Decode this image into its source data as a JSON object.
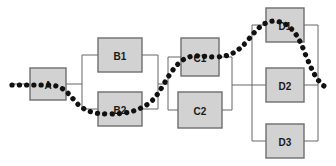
{
  "diagram": {
    "type": "reliability-block-diagram",
    "title": "",
    "canvas": {
      "width": 336,
      "height": 166
    },
    "style": {
      "block_fill": "#d2d2d2",
      "block_border": "#6e6e6e",
      "connector_color": "#666666",
      "trace_color": "#111111",
      "background": "#ffffff"
    },
    "blocks": [
      {
        "id": "A",
        "label": "A",
        "x": 30,
        "y": 68,
        "w": 36,
        "h": 32,
        "stage": "A",
        "label_obscured": true
      },
      {
        "id": "B1",
        "label": "B1",
        "x": 98,
        "y": 38,
        "w": 44,
        "h": 34,
        "stage": "B",
        "label_obscured": false
      },
      {
        "id": "B2",
        "label": "B2",
        "x": 98,
        "y": 92,
        "w": 44,
        "h": 34,
        "stage": "B",
        "label_obscured": true
      },
      {
        "id": "C1",
        "label": "C1",
        "x": 181,
        "y": 38,
        "w": 38,
        "h": 38,
        "stage": "C",
        "label_obscured": true
      },
      {
        "id": "C2",
        "label": "C2",
        "x": 178,
        "y": 92,
        "w": 44,
        "h": 36,
        "stage": "C",
        "label_obscured": false
      },
      {
        "id": "D1",
        "label": "D1",
        "x": 266,
        "y": 8,
        "w": 38,
        "h": 34,
        "stage": "D",
        "label_obscured": true
      },
      {
        "id": "D2",
        "label": "D2",
        "x": 266,
        "y": 68,
        "w": 38,
        "h": 34,
        "stage": "D",
        "label_obscured": false
      },
      {
        "id": "D3",
        "label": "D3",
        "x": 266,
        "y": 124,
        "w": 38,
        "h": 34,
        "stage": "D",
        "label_obscured": false
      }
    ],
    "stages": [
      {
        "name": "A",
        "kind": "series",
        "members": [
          "A"
        ]
      },
      {
        "name": "B",
        "kind": "parallel",
        "members": [
          "B1",
          "B2"
        ]
      },
      {
        "name": "C",
        "kind": "parallel",
        "members": [
          "C1",
          "C2"
        ]
      },
      {
        "name": "D",
        "kind": "parallel",
        "members": [
          "D1",
          "D2",
          "D3"
        ]
      }
    ],
    "connectors": [
      {
        "id": "in-to-a",
        "from": "input",
        "to": "A"
      },
      {
        "id": "a-to-bfork",
        "from": "A",
        "to": "b-fork"
      },
      {
        "id": "bfork-b1",
        "from": "b-fork",
        "to": "B1"
      },
      {
        "id": "bfork-b2",
        "from": "b-fork",
        "to": "B2"
      },
      {
        "id": "b1-bjoin",
        "from": "B1",
        "to": "b-join"
      },
      {
        "id": "b2-bjoin",
        "from": "B2",
        "to": "b-join"
      },
      {
        "id": "bjoin-cfork",
        "from": "b-join",
        "to": "c-fork"
      },
      {
        "id": "cfork-c1",
        "from": "c-fork",
        "to": "C1"
      },
      {
        "id": "cfork-c2",
        "from": "c-fork",
        "to": "C2"
      },
      {
        "id": "c1-cjoin",
        "from": "C1",
        "to": "c-join"
      },
      {
        "id": "c2-cjoin",
        "from": "C2",
        "to": "c-join"
      },
      {
        "id": "cjoin-dfork",
        "from": "c-join",
        "to": "d-fork"
      },
      {
        "id": "dfork-d1",
        "from": "d-fork",
        "to": "D1"
      },
      {
        "id": "dfork-d2",
        "from": "d-fork",
        "to": "D2"
      },
      {
        "id": "dfork-d3",
        "from": "d-fork",
        "to": "D3"
      },
      {
        "id": "d1-djoin",
        "from": "D1",
        "to": "d-join"
      },
      {
        "id": "d2-djoin",
        "from": "D2",
        "to": "d-join"
      },
      {
        "id": "d3-djoin",
        "from": "D3",
        "to": "d-join"
      }
    ],
    "trace": {
      "name": "success-path",
      "description": "dotted path through A, B2, C1, D1",
      "visits": [
        "A",
        "B2",
        "C1",
        "D1"
      ],
      "style": "thick-dotted"
    }
  }
}
